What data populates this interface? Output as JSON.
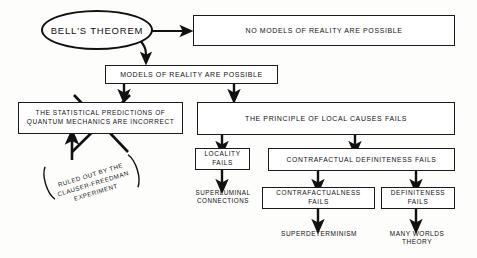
{
  "diagram": {
    "ink_color": "#111111",
    "paper_color": "#fdfdfb",
    "nodes": {
      "root": "BELL'S  THEOREM",
      "no_models": "NO  MODELS  OF  REALITY  ARE  POSSIBLE",
      "models_possible": "MODELS  OF  REALITY  ARE  POSSIBLE",
      "statistical_predictions": "THE  STATISTICAL  PREDICTIONS  OF\nQUANTUM  MECHANICS  ARE  INCORRECT",
      "local_causes": "THE  PRINCIPLE  OF  LOCAL  CAUSES  FAILS",
      "locality_fails": "LOCALITY  FAILS",
      "superluminal": "SUPERLUMINAL\nCONNECTIONS",
      "contrafactual_definiteness": "CONTRAFACTUAL   DEFINITENESS   FAILS",
      "contrafactualness_fails": "CONTRAFACTUALNESS   FAILS",
      "definiteness_fails": "DEFINITENESS   FAILS",
      "superdeterminism": "SUPERDETERMINISM",
      "many_worlds": "MANY WORLDS THEORY"
    },
    "annotation": {
      "ruled_out": "RULED  OUT  BY  THE\nCLAUSER-FREEDMAN\nEXPERIMENT",
      "crossed_out_marker": "X",
      "bracket_left": "(",
      "bracket_right": ")"
    }
  }
}
